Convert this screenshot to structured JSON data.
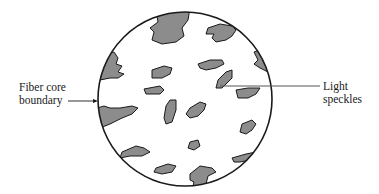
{
  "diagram": {
    "type": "fiber cross-section speckle pattern",
    "colors": {
      "speckle_fill": "#8c8c8c",
      "outline": "#1a1a1a",
      "leader": "#555555",
      "background": "#ffffff"
    },
    "labels": {
      "fiber_core_boundary": {
        "line1": "Fiber core",
        "line2": "boundary"
      },
      "light_speckles": {
        "line1": "Light",
        "line2": "speckles"
      }
    }
  }
}
